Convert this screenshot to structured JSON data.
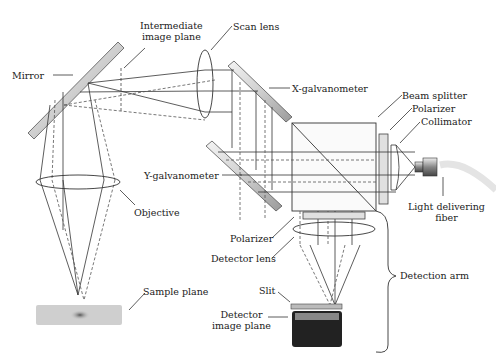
{
  "diagram": {
    "labels": {
      "mirror": "Mirror",
      "intermediate_line1": "Intermediate",
      "intermediate_line2": "image plane",
      "scan_lens": "Scan lens",
      "x_galvo": "X-galvanometer",
      "beam_splitter": "Beam splitter",
      "polarizer_top": "Polarizer",
      "collimator": "Collimator",
      "y_galvo": "Y-galvanometer",
      "objective": "Objective",
      "light_fiber_line1": "Light delivering",
      "light_fiber_line2": "fiber",
      "polarizer_bottom": "Polarizer",
      "detector_lens": "Detector lens",
      "detection_arm": "Detection arm",
      "sample_plane": "Sample plane",
      "slit": "Slit",
      "detector_line1": "Detector",
      "detector_line2": "image plane"
    },
    "colors": {
      "line": "#333333",
      "component_fill": "#dddddd",
      "detector_body": "#222222",
      "sample": "#cccccc",
      "fiber": "#e6e6e6"
    }
  }
}
